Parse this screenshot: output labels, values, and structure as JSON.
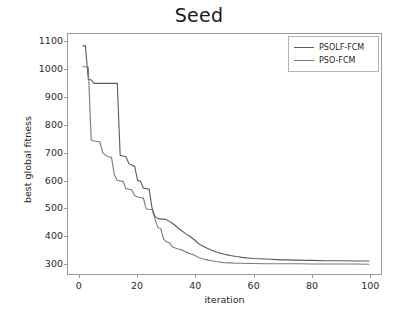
{
  "chart_data": {
    "type": "line",
    "title": "Seed",
    "xlabel": "iteration",
    "ylabel": "best global fitness",
    "xlim": [
      -4,
      104
    ],
    "ylim": [
      262,
      1128
    ],
    "xticks": [
      0,
      20,
      40,
      60,
      80,
      100
    ],
    "yticks": [
      300,
      400,
      500,
      600,
      700,
      800,
      900,
      1000,
      1100
    ],
    "grid": false,
    "legend_position": "upper right",
    "series": [
      {
        "name": "PSOLF-FCM",
        "color": "#5a5a5a",
        "x": [
          1,
          2,
          3,
          4,
          5,
          6,
          7,
          8,
          9,
          10,
          11,
          12,
          13,
          14,
          15,
          16,
          17,
          18,
          19,
          20,
          21,
          22,
          23,
          24,
          25,
          26,
          27,
          28,
          29,
          30,
          31,
          32,
          33,
          34,
          35,
          36,
          37,
          38,
          39,
          40,
          41,
          42,
          43,
          44,
          45,
          46,
          47,
          48,
          49,
          50,
          51,
          52,
          53,
          54,
          55,
          56,
          57,
          58,
          59,
          60,
          62,
          64,
          66,
          68,
          70,
          72,
          74,
          76,
          78,
          80,
          85,
          90,
          95,
          100
        ],
        "values": [
          1085,
          1085,
          965,
          962,
          950,
          950,
          950,
          950,
          950,
          950,
          950,
          950,
          950,
          690,
          688,
          685,
          660,
          655,
          650,
          600,
          597,
          572,
          570,
          568,
          500,
          470,
          462,
          460,
          460,
          458,
          452,
          445,
          437,
          428,
          420,
          412,
          404,
          398,
          390,
          382,
          372,
          366,
          360,
          355,
          350,
          346,
          342,
          339,
          336,
          333,
          331,
          329,
          327,
          325,
          324,
          322,
          321,
          320,
          319,
          318,
          317,
          316,
          315,
          314,
          313,
          313,
          312,
          312,
          311,
          311,
          310,
          310,
          309,
          309
        ]
      },
      {
        "name": "PSO-FCM",
        "color": "#7a7a7a",
        "x": [
          1,
          2,
          3,
          4,
          5,
          6,
          7,
          8,
          9,
          10,
          11,
          12,
          13,
          14,
          15,
          16,
          17,
          18,
          19,
          20,
          21,
          22,
          23,
          24,
          25,
          26,
          27,
          28,
          29,
          30,
          31,
          32,
          33,
          34,
          35,
          36,
          37,
          38,
          39,
          40,
          41,
          42,
          43,
          44,
          45,
          46,
          47,
          48,
          49,
          50,
          52,
          54,
          56,
          58,
          60,
          64,
          68,
          72,
          76,
          80,
          85,
          90,
          95,
          100
        ],
        "values": [
          1010,
          1010,
          1008,
          745,
          742,
          740,
          738,
          700,
          690,
          685,
          683,
          620,
          600,
          598,
          596,
          570,
          568,
          566,
          545,
          540,
          538,
          536,
          497,
          495,
          495,
          460,
          430,
          425,
          388,
          378,
          375,
          360,
          356,
          352,
          350,
          345,
          340,
          336,
          332,
          328,
          322,
          318,
          315,
          313,
          311,
          309,
          307,
          306,
          304,
          303,
          302,
          301,
          301,
          300,
          300,
          299,
          299,
          299,
          299,
          298,
          298,
          298,
          298,
          297
        ]
      }
    ]
  },
  "legend": {
    "items": [
      {
        "label": "PSOLF-FCM"
      },
      {
        "label": "PSO-FCM"
      }
    ]
  }
}
